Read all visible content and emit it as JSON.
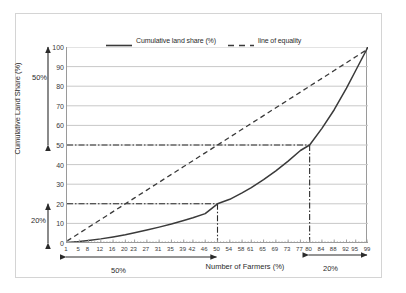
{
  "chart_data": {
    "type": "line",
    "title": "",
    "xlabel": "Number of Farmers (%)",
    "ylabel": "Cumulative Land Share (%)",
    "xlim": [
      1,
      99
    ],
    "ylim": [
      0,
      100
    ],
    "grid": true,
    "legend_position": "top",
    "x": [
      1,
      5,
      8,
      12,
      16,
      20,
      23,
      27,
      31,
      35,
      39,
      42,
      46,
      50,
      54,
      58,
      61,
      65,
      69,
      73,
      77,
      80,
      84,
      88,
      92,
      95,
      99
    ],
    "xtick_labels": [
      "1",
      "5",
      "8",
      "12",
      "16",
      "20",
      "23",
      "27",
      "31",
      "35",
      "39",
      "42",
      "46",
      "50",
      "54",
      "58",
      "61",
      "65",
      "69",
      "73",
      "77",
      "80",
      "84",
      "88",
      "92",
      "95",
      "99"
    ],
    "ytick_labels": [
      "0",
      "10",
      "20",
      "30",
      "40",
      "50",
      "60",
      "70",
      "80",
      "90",
      "100"
    ],
    "yticks": [
      0,
      10,
      20,
      30,
      40,
      50,
      60,
      70,
      80,
      90,
      100
    ],
    "series": [
      {
        "name": "Cumulative land share (%)",
        "style": "solid",
        "color": "#3a3a3a",
        "values": [
          0.3,
          0.8,
          1.3,
          2.1,
          3.1,
          4.2,
          5.2,
          6.6,
          8.1,
          9.7,
          11.5,
          12.9,
          15.0,
          20.0,
          22.3,
          25.6,
          28.3,
          32.3,
          36.8,
          41.8,
          47.2,
          50.0,
          58.5,
          68.0,
          79.0,
          88.0,
          100.0
        ]
      },
      {
        "name": "line of equality",
        "style": "dashed",
        "color": "#3a3a3a",
        "values": [
          1,
          5,
          8,
          12,
          16,
          20,
          23,
          27,
          31,
          35,
          39,
          42,
          46,
          50,
          54,
          58,
          61,
          65,
          69,
          73,
          77,
          80,
          84,
          88,
          92,
          95,
          99
        ]
      }
    ],
    "reference_lines": [
      {
        "name": "ref-20",
        "x": 50,
        "y": 20,
        "style": "dash-dot"
      },
      {
        "name": "ref-50",
        "x": 80,
        "y": 50,
        "style": "dash-dot"
      }
    ],
    "annotations": [
      {
        "name": "y-bracket-upper",
        "label": "50%",
        "axis": "y",
        "from": 50,
        "to": 100
      },
      {
        "name": "y-bracket-lower",
        "label": "20%",
        "axis": "y",
        "from": 0,
        "to": 20
      },
      {
        "name": "x-bracket-left",
        "label": "50%",
        "axis": "x",
        "from": 1,
        "to": 50
      },
      {
        "name": "x-bracket-right",
        "label": "20%",
        "axis": "x",
        "from": 80,
        "to": 99
      }
    ]
  },
  "legend": {
    "entries": [
      {
        "label": "Cumulative land share (%)"
      },
      {
        "label": "line of equality"
      }
    ]
  },
  "axes": {
    "x_title": "Number of Farmers (%)",
    "y_title": "Cumulative Land Share (%)"
  },
  "annotation_labels": {
    "y_upper": "50%",
    "y_lower": "20%",
    "x_left": "50%",
    "x_right": "20%"
  },
  "colors": {
    "line": "#3a3a3a",
    "grid": "#c8c8c8",
    "axis": "#9a9a9a",
    "frame": "#d4d4d4",
    "text": "#2b2b2b"
  }
}
